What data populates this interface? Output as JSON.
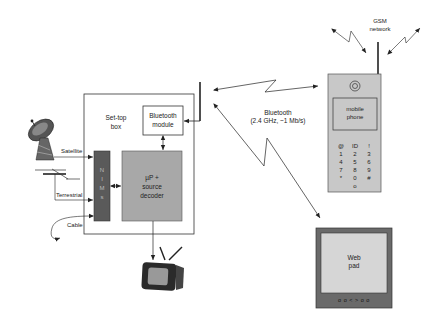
{
  "diagram": {
    "settop": {
      "label_line1": "Set-top",
      "label_line2": "box",
      "bluetooth_module_line1": "Bluetooth",
      "bluetooth_module_line2": "module",
      "nim_letters": [
        "N",
        "I",
        "M",
        "s"
      ],
      "decoder_line1": "µP +",
      "decoder_line2": "source",
      "decoder_line3": "decoder"
    },
    "inputs": {
      "satellite": "Satellite",
      "terrestrial": "Terrestrial",
      "cable": "Cable"
    },
    "bluetooth_link": {
      "line1": "Bluetooth",
      "line2": "(2.4 GHz, ~1 Mb/s)"
    },
    "gsm": {
      "line1": "GSM",
      "line2": "network"
    },
    "phone": {
      "screen_line1": "mobile",
      "screen_line2": "phone",
      "keypad_rows": [
        [
          "@",
          "ID",
          "!"
        ],
        [
          "1",
          "2",
          "3"
        ],
        [
          "4",
          "5",
          "6"
        ],
        [
          "7",
          "8",
          "9"
        ],
        [
          "*",
          "0",
          "#"
        ],
        [
          "",
          "o",
          ""
        ]
      ]
    },
    "webpad": {
      "line1": "Web",
      "line2": "pad",
      "buttons": "o o < > o o"
    },
    "colors": {
      "nim_block": "#5a5a5a",
      "decoder_block": "#a8a8a8",
      "device_body": "#c8c8c8",
      "webpad_frame": "#6a6a6a",
      "webpad_screen": "#d6d6d6",
      "line": "#222222"
    }
  }
}
